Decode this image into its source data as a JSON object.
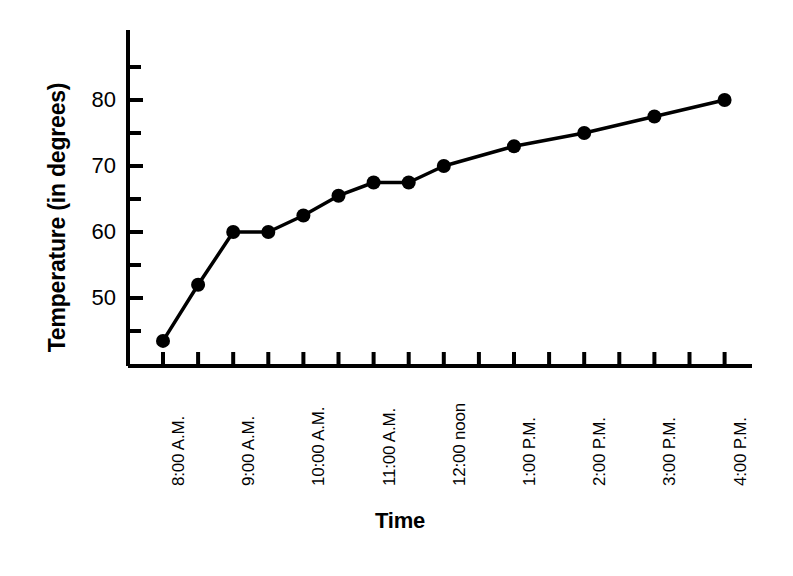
{
  "chart_data": {
    "type": "line",
    "title": "",
    "xlabel": "Time",
    "ylabel": "Temperature (in degrees)",
    "x_tick_labels": [
      "8:00 A.M.",
      "9:00 A.M.",
      "10:00 A.M.",
      "11:00 A.M.",
      "12:00 noon",
      "1:00 P.M.",
      "2:00 P.M.",
      "3:00 P.M.",
      "4:00 P.M."
    ],
    "y_tick_labels": [
      "50",
      "60",
      "70",
      "80"
    ],
    "y_tick_values": [
      50,
      60,
      70,
      80
    ],
    "y_minor_tick_values": [
      45,
      55,
      65,
      75,
      85
    ],
    "ylim": [
      40,
      87
    ],
    "grid": false,
    "legend": null,
    "marker": "filled-circle",
    "line_color": "#000000",
    "categories": [
      "8:00 A.M.",
      "8:30 A.M.",
      "9:00 A.M.",
      "9:30 A.M.",
      "10:00 A.M.",
      "10:30 A.M.",
      "11:00 A.M.",
      "11:30 A.M.",
      "12:00 noon",
      "1:00 P.M.",
      "2:00 P.M.",
      "3:00 P.M.",
      "4:00 P.M."
    ],
    "values": [
      43.5,
      52,
      60,
      60,
      62.5,
      65.5,
      67.5,
      67.5,
      70,
      73,
      75,
      77.5,
      80
    ]
  },
  "axis": {
    "x_title": "Time",
    "y_title": "Temperature (in degrees)"
  }
}
